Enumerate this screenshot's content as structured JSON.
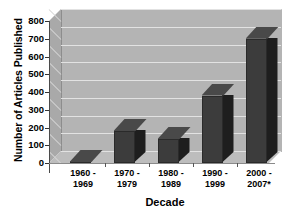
{
  "chart_data": {
    "type": "bar",
    "title": "",
    "xlabel": "Decade",
    "ylabel": "Number of Articles Published",
    "categories": [
      "1960 -\n1969",
      "1970 -\n1979",
      "1980 -\n1989",
      "1990 -\n1999",
      "2000 -\n2007*"
    ],
    "category_lines": [
      [
        "1960 -",
        "1969"
      ],
      [
        "1970 -",
        "1979"
      ],
      [
        "1980 -",
        "1989"
      ],
      [
        "1990 -",
        "1999"
      ],
      [
        "2000 -",
        "2007*"
      ]
    ],
    "values": [
      5,
      180,
      135,
      380,
      700
    ],
    "ylim": [
      0,
      800
    ],
    "ytick_values": [
      800,
      700,
      600,
      500,
      400,
      300,
      200,
      100,
      0
    ],
    "ytick_labels": [
      "800",
      "700",
      "600",
      "500",
      "400",
      "300",
      "200",
      "100",
      "0"
    ],
    "grid": true,
    "legend": "none",
    "style": "3d-column",
    "colors": {
      "bar_front": "#3c3c3c",
      "bar_side": "#1e1e1e",
      "bar_top": "#494949",
      "plot_background": "#b4b4b4",
      "floor": "#bdbdbd",
      "left_wall": "#a9a9a9",
      "gridline": "#e2e2e2",
      "axis": "#4a4a4a",
      "page_background": "#ffffff",
      "text": "#000000"
    }
  }
}
